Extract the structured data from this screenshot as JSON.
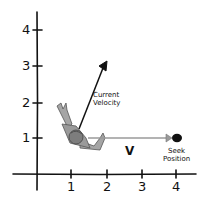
{
  "diagram": {
    "title": "",
    "axes": {
      "x_ticks": [
        "1",
        "2",
        "3",
        "4"
      ],
      "y_ticks": [
        "1",
        "2",
        "3",
        "4"
      ]
    },
    "labels": {
      "current_velocity_line1": "Current",
      "current_velocity_line2": "Velocity",
      "desired_velocity": "V",
      "seek_position_line1": "Seek",
      "seek_position_line2": "Position"
    },
    "elements": {
      "agent": "character-figure",
      "current_velocity_arrow": {
        "from": [
          1.2,
          1.2
        ],
        "to": [
          2,
          3.1
        ],
        "color": "#111111"
      },
      "desired_velocity_arrow": {
        "from": [
          1.5,
          1
        ],
        "to": [
          4,
          1
        ],
        "color": "#9a9a9a"
      },
      "seek_target": {
        "position": [
          4,
          1
        ],
        "color": "#111111"
      }
    },
    "colors": {
      "axis": "#111111",
      "figure": "#8c8c8c",
      "desired_arrow": "#9a9a9a"
    }
  }
}
